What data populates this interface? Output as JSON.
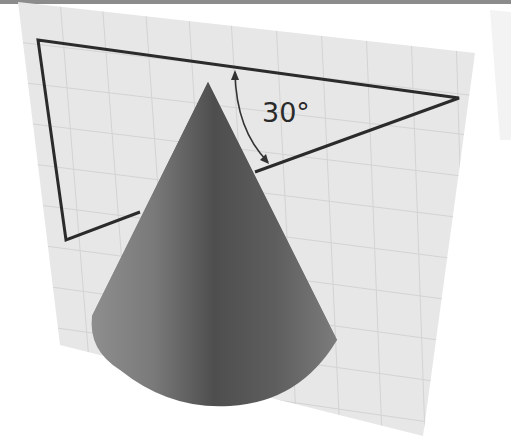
{
  "figure": {
    "angle_label": "30°",
    "angle_value_deg": 30,
    "colors": {
      "background": "#ffffff",
      "top_strip": "#8c8c8c",
      "plane": "#e6e6e6",
      "grid": "#d2d2d2",
      "triangle_stroke": "#2b2b2b",
      "cone_light": "#8a8a8a",
      "cone_dark": "#4a4a4a"
    }
  }
}
